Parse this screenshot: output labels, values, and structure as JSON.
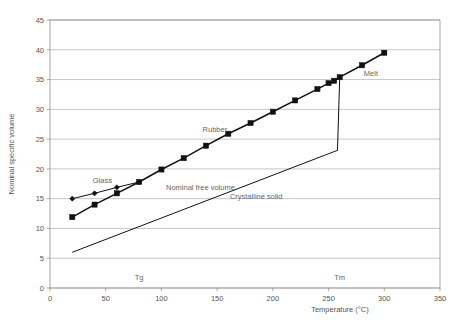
{
  "chart_data": {
    "type": "line",
    "title": "",
    "xlabel": "Temperature (°C)",
    "ylabel": "Nominal specific volume",
    "xlim": [
      0,
      350
    ],
    "ylim": [
      0,
      45
    ],
    "xticks": [
      0,
      50,
      100,
      150,
      200,
      250,
      300,
      350
    ],
    "yticks": [
      0,
      5,
      10,
      15,
      20,
      25,
      30,
      35,
      40,
      45
    ],
    "grid": "horizontal",
    "legend": "none",
    "series": [
      {
        "name": "Glass",
        "marker": "diamond",
        "x": [
          20,
          40,
          60,
          80
        ],
        "y": [
          15.0,
          15.9,
          16.9,
          17.8
        ]
      },
      {
        "name": "Rubber / Melt",
        "marker": "square",
        "x": [
          20,
          40,
          60,
          80,
          100,
          120,
          140,
          160,
          180,
          200,
          220,
          240,
          250,
          255,
          260,
          280,
          300
        ],
        "y": [
          11.9,
          14.0,
          15.9,
          17.8,
          19.9,
          21.8,
          23.9,
          25.9,
          27.7,
          29.6,
          31.5,
          33.4,
          34.4,
          34.8,
          35.4,
          37.4,
          39.5
        ]
      },
      {
        "name": "Crystalline solid",
        "marker": "none",
        "x": [
          20,
          255,
          258,
          260
        ],
        "y": [
          6.0,
          22.9,
          23.1,
          35.4
        ]
      }
    ],
    "annotations": [
      {
        "label": "Glass",
        "x": 47,
        "y": 17.6
      },
      {
        "label": "Rubber",
        "x": 148,
        "y": 26.2
      },
      {
        "label": "Melt",
        "x": 288,
        "y": 35.6
      },
      {
        "label": "Nominal free volume",
        "x": 135,
        "y": 16.5
      },
      {
        "label": "Crystalline solid",
        "x": 185,
        "y": 15.0
      },
      {
        "label": "Tg",
        "x": 80,
        "y": 1.3
      },
      {
        "label": "Tm",
        "x": 260,
        "y": 1.3
      }
    ]
  },
  "colors": {
    "series": "#111111",
    "grid": "#b0b0b0",
    "axis": "#909090",
    "text": "#555555",
    "annotation": "#666666",
    "background": "#ffffff"
  }
}
